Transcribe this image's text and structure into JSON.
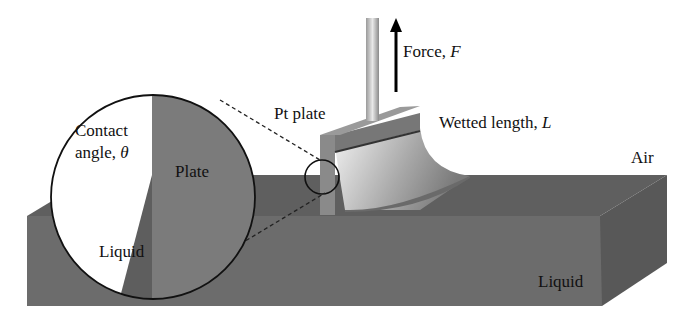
{
  "figure": {
    "labels": {
      "force": "Force, ",
      "force_symbol": "F",
      "pt_plate": "Pt plate",
      "wetted_length": "Wetted length, ",
      "wetted_length_symbol": "L",
      "air": "Air",
      "liquid_bath": "Liquid",
      "inset_contact_angle_line1": "Contact",
      "inset_contact_angle_line2": "angle, ",
      "inset_contact_angle_symbol": "θ",
      "inset_plate": "Plate",
      "inset_liquid": "Liquid"
    },
    "colors": {
      "liquid_front": "#6e6e6e",
      "liquid_top": "#5e5e5e",
      "liquid_side": "#555555",
      "plate": "#7d7d7d",
      "meniscus_light": "#e6e6e6",
      "outline": "#111111"
    }
  }
}
